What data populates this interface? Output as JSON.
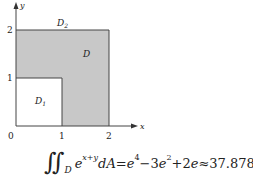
{
  "diagram": {
    "axes": {
      "x_label": "x",
      "y_label": "y",
      "origin_label": "0",
      "x_ticks": [
        "1",
        "2"
      ],
      "y_ticks": [
        "1",
        "2"
      ]
    },
    "regions": {
      "D_label": "D",
      "D1_label": "D",
      "D1_sub": "1",
      "D2_label": "D",
      "D2_sub": "2"
    },
    "colors": {
      "shaded": "#c8c8c8",
      "outline": "#444444",
      "background": "#ffffff"
    }
  },
  "formula": {
    "integral": "∬",
    "domain": "D",
    "integrand_base": "e",
    "integrand_exp": "x+y",
    "differential": "dA",
    "eq": "=",
    "t1_base": "e",
    "t1_exp": "4",
    "minus": "−",
    "t2_coef": "3",
    "t2_base": "e",
    "t2_exp": "2",
    "plus": "+",
    "t3_coef": "2",
    "t3_base": "e",
    "approx": "≈",
    "value": "37.878"
  }
}
